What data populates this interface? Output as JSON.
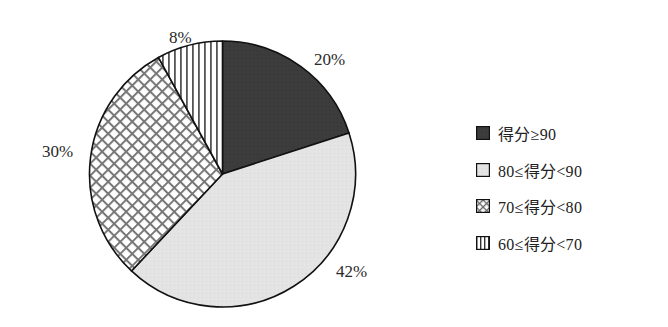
{
  "chart_data": {
    "type": "pie",
    "title": "",
    "start_angle_deg": 0,
    "direction": "clockwise",
    "categories": [
      "得分≥90",
      "80≤得分<90",
      "70≤得分<80",
      "60≤得分<70"
    ],
    "values": [
      20,
      42,
      30,
      8
    ],
    "unit": "%",
    "data_labels": [
      "20%",
      "42%",
      "30%",
      "8%"
    ],
    "fills": [
      "solid-dark",
      "solid-light",
      "crosshatch",
      "vertical-stripes"
    ],
    "colors": [
      "#3a3a3a",
      "#e2e2e2",
      "#ffffff",
      "#ffffff"
    ],
    "legend_position": "right"
  },
  "labels": {
    "s0": "20%",
    "s1": "42%",
    "s2": "30%",
    "s3": "8%"
  },
  "legend": [
    {
      "label": "得分≥90",
      "pattern": "dark"
    },
    {
      "label": "80≤得分<90",
      "pattern": "light"
    },
    {
      "label": "70≤得分<80",
      "pattern": "crosshatch"
    },
    {
      "label": "60≤得分<70",
      "pattern": "vstripes"
    }
  ]
}
